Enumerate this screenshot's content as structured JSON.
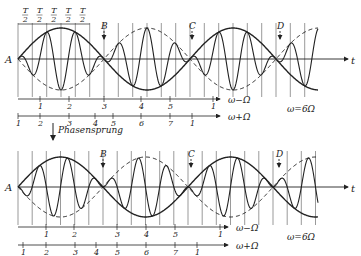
{
  "figure": {
    "top_panel": {
      "origin_label": "A",
      "time_axis_label": "t",
      "markers": [
        {
          "label": "B",
          "x": 104
        },
        {
          "label": "C",
          "x": 192
        },
        {
          "label": "D",
          "x": 280
        }
      ],
      "half_period_label_num": "T",
      "half_period_label_den": "2",
      "half_period_count": 5,
      "scale_minus": {
        "label": "ω−Ω",
        "ticks": [
          {
            "label": "1",
            "x": 40
          },
          {
            "label": "2",
            "x": 69
          },
          {
            "label": "3",
            "x": 104
          },
          {
            "label": "4",
            "x": 141
          },
          {
            "label": "5",
            "x": 170
          },
          {
            "label": "1",
            "x": 213
          }
        ]
      },
      "scale_plus": {
        "label": "ω+Ω",
        "ticks": [
          {
            "label": "1",
            "x": 18
          },
          {
            "label": "2",
            "x": 40
          },
          {
            "label": "3",
            "x": 69
          },
          {
            "label": "4",
            "x": 95
          },
          {
            "label": "5",
            "x": 113
          },
          {
            "label": "6",
            "x": 141
          },
          {
            "label": "7",
            "x": 170
          },
          {
            "label": "1",
            "x": 192
          }
        ]
      },
      "ratio_label": "ω=6Ω"
    },
    "phase_jump_label": "Phasensprung",
    "bottom_panel": {
      "origin_label": "A",
      "time_axis_label": "t",
      "markers": [
        {
          "label": "B",
          "x": 103
        },
        {
          "label": "C",
          "x": 191
        },
        {
          "label": "D",
          "x": 279
        }
      ],
      "scale_minus": {
        "label": "ω−Ω",
        "ticks": [
          {
            "label": "1",
            "x": 46
          },
          {
            "label": "2",
            "x": 74
          },
          {
            "label": "3",
            "x": 117
          },
          {
            "label": "4",
            "x": 146
          },
          {
            "label": "5",
            "x": 175
          },
          {
            "label": "1",
            "x": 220
          }
        ]
      },
      "scale_plus": {
        "label": "ω+Ω",
        "ticks": [
          {
            "label": "1",
            "x": 23
          },
          {
            "label": "2",
            "x": 46
          },
          {
            "label": "3",
            "x": 75
          },
          {
            "label": "4",
            "x": 96
          },
          {
            "label": "5",
            "x": 117
          },
          {
            "label": "6",
            "x": 146
          },
          {
            "label": "7",
            "x": 175
          },
          {
            "label": "1",
            "x": 197
          }
        ]
      },
      "ratio_label": "ω=6Ω"
    }
  }
}
